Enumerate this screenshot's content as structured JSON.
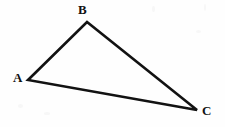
{
  "figure": {
    "kind": "geometry-figure",
    "shape": "triangle",
    "background_color": "#fefefe",
    "stroke_color": "#121212",
    "stroke_width": 2.6,
    "canvas": {
      "width": 225,
      "height": 127
    },
    "vertices": [
      {
        "id": "A",
        "label": "A",
        "x": 28,
        "y": 80,
        "label_x": 13,
        "label_y": 71
      },
      {
        "id": "B",
        "label": "B",
        "x": 87,
        "y": 22,
        "label_x": 78,
        "label_y": 3
      },
      {
        "id": "C",
        "label": "C",
        "x": 197,
        "y": 110,
        "label_x": 202,
        "label_y": 104
      }
    ],
    "edges": [
      {
        "id": "AB",
        "from": "A",
        "to": "B"
      },
      {
        "id": "BC",
        "from": "B",
        "to": "C"
      },
      {
        "id": "CA",
        "from": "C",
        "to": "A"
      }
    ],
    "path": "M 28 80 L 87 22 L 197 110 Z"
  },
  "chart_data": {
    "type": "scatter",
    "title": "",
    "xlabel": "",
    "ylabel": "",
    "categories": [
      "A",
      "B",
      "C"
    ],
    "x": [
      28,
      87,
      197
    ],
    "y": [
      80,
      22,
      110
    ],
    "xlim": [
      0,
      225
    ],
    "ylim": [
      0,
      127
    ],
    "grid": false,
    "legend": "none",
    "annotations": [
      "A",
      "B",
      "C"
    ]
  }
}
